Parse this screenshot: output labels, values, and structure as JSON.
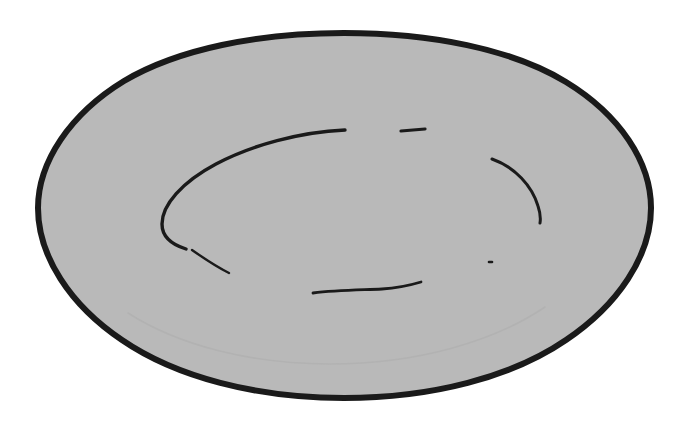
{
  "document": {
    "title": "Hand-drawn plate sketch",
    "width": 686,
    "height": 421,
    "background_color": "#ffffff",
    "media": "ink line drawing on paper, scanned",
    "subject": "oval plate / dish seen in perspective"
  },
  "palette": {
    "paper_white": "#ffffff",
    "fill_gray": "#b9b9b9",
    "ink_black": "#1a1a1a",
    "faint_gray": "#b2b2b2"
  },
  "shapes": {
    "outline": {
      "name": "plate-rim-outline",
      "description": "closed hand-drawn oval, slightly irregular, thick black ink outline with flat gray fill",
      "fill": "#b9b9b9",
      "stroke": "#1a1a1a",
      "stroke_width": 6,
      "bounds": {
        "x": 38,
        "y": 33,
        "width": 614,
        "height": 365
      },
      "path": "M 344 33 C 430 33 512 49 566 82 C 620 115 651 162 651 208 C 651 256 618 305 566 340 C 512 377 432 398 344 398 C 256 398 176 377 122 340 C 70 305 38 256 38 208 C 38 162 70 114 124 81 C 178 49 258 33 344 33 Z"
    },
    "strokes": [
      {
        "name": "inner-well-arc-major",
        "description": "long sweeping C-shaped arc forming the inner well of the plate, tapering at both ends",
        "stroke": "#1a1a1a",
        "stroke_width": 3.4,
        "path": "M 345 130 C 300 132 252 145 216 164 C 182 182 162 205 162 224 C 162 236 170 244 186 249"
      },
      {
        "name": "inner-well-arc-tail",
        "description": "short detached continuation stroke below the major arc's lower-left end",
        "stroke": "#1a1a1a",
        "stroke_width": 2.4,
        "path": "M 192 250 C 202 257 215 266 229 273"
      },
      {
        "name": "inner-well-arc-right",
        "description": "short crescent arc on the right side of the inner well",
        "stroke": "#1a1a1a",
        "stroke_width": 3.0,
        "path": "M 492 159 C 515 167 532 186 538 206 C 540 212 541 217 540 223"
      },
      {
        "name": "inner-well-dash-top",
        "description": "small horizontal dash near the top of the inner well",
        "stroke": "#1a1a1a",
        "stroke_width": 3.2,
        "path": "M 401 131 L 425 129"
      },
      {
        "name": "inner-well-arc-bottom",
        "description": "shallow wavy stroke across the lower inner well",
        "stroke": "#1a1a1a",
        "stroke_width": 2.8,
        "path": "M 313 293 C 336 290 360 290 382 289 C 399 288 411 285 421 282"
      },
      {
        "name": "inner-well-dot",
        "description": "tiny isolated ink dot at the right of the inner well",
        "stroke": "#1a1a1a",
        "stroke_width": 2.6,
        "path": "M 489 262 L 492 262"
      },
      {
        "name": "plate-base-ghost-arc",
        "description": "very faint lighter arc suggesting the plate base, barely visible",
        "stroke": "#b2b2b2",
        "stroke_width": 1.6,
        "path": "M 128 313 C 178 345 250 364 330 364 C 418 364 495 341 545 307"
      }
    ]
  }
}
